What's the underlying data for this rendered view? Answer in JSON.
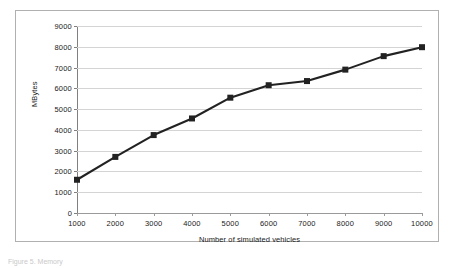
{
  "figure": {
    "caption": "Figure 5. Memory"
  },
  "chart_data": {
    "type": "line",
    "title": "",
    "subtitle": "",
    "xlabel": "Number of simulated vehicles",
    "ylabel": "MBytes",
    "x": [
      1000,
      2000,
      3000,
      4000,
      5000,
      6000,
      7000,
      8000,
      9000,
      10000
    ],
    "values": [
      1600,
      2700,
      3750,
      4550,
      5550,
      6150,
      6350,
      6900,
      7550,
      7980
    ],
    "series": [
      {
        "name": "MBytes",
        "values": [
          1600,
          2700,
          3750,
          4550,
          5550,
          6150,
          6350,
          6900,
          7550,
          7980
        ]
      }
    ],
    "xlim": [
      1000,
      10000
    ],
    "ylim": [
      0,
      9000
    ],
    "x_tick_labels": [
      "1000",
      "2000",
      "3000",
      "4000",
      "5000",
      "6000",
      "7000",
      "8000",
      "9000",
      "10000"
    ],
    "y_tick_labels": [
      "0",
      "1000",
      "2000",
      "3000",
      "4000",
      "5000",
      "6000",
      "7000",
      "8000",
      "9000"
    ],
    "y_ticks": [
      0,
      1000,
      2000,
      3000,
      4000,
      5000,
      6000,
      7000,
      8000,
      9000
    ],
    "grid": "horizontal",
    "legend": "none",
    "marker": "square",
    "line_color": "#222222",
    "marker_color": "#222222",
    "gridline_color": "#d4d4d4",
    "axis_color": "#808080",
    "background_color": "#ffffff",
    "border_color": "#b0b0b0"
  }
}
